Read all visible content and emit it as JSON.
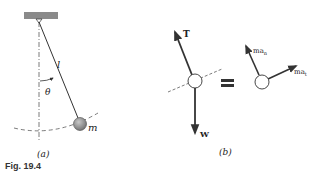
{
  "figure": {
    "caption": "Fig. 19.4",
    "panel_a": {
      "label": "(a)",
      "length_label": "l",
      "angle_label": "θ",
      "mass_label": "m"
    },
    "panel_b": {
      "label": "(b)",
      "tension_label": "T",
      "weight_label": "W",
      "equals": "=",
      "normal_accel_label": "ma",
      "normal_accel_sub": "n",
      "tangential_accel_label": "ma",
      "tangential_accel_sub": "t"
    },
    "colors": {
      "support": "#8a8a8a",
      "bob": "#8c8c8c",
      "ink": "#333333"
    }
  }
}
